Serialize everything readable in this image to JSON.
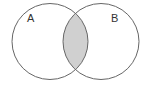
{
  "diagram": {
    "type": "venn",
    "sets": [
      {
        "label": "A",
        "cx": 50,
        "cy": 41.5,
        "r": 38,
        "label_x": 27,
        "label_y": 22
      },
      {
        "label": "B",
        "cx": 101,
        "cy": 41.5,
        "r": 38,
        "label_x": 111,
        "label_y": 22
      }
    ],
    "intersection": {
      "shaded": true,
      "fill": "#d0d0d0"
    },
    "stroke": "#666666",
    "background": "#ffffff"
  }
}
